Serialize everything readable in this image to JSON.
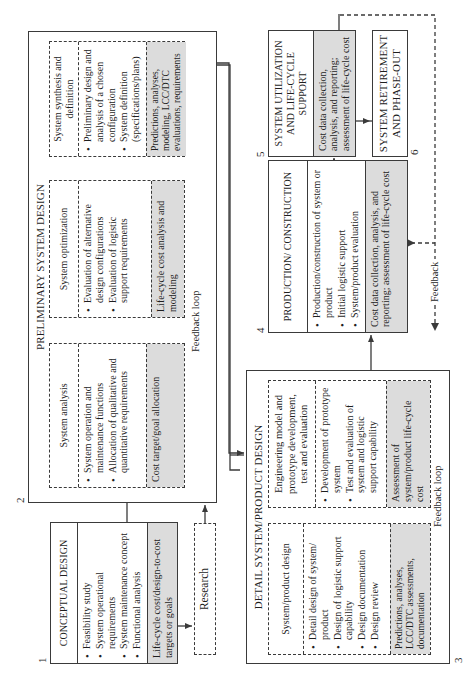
{
  "phases": {
    "conceptual": {
      "number": "1",
      "title": "CONCEPTUAL DESIGN",
      "items": [
        "Feasibility study",
        "System operational requirements",
        "System maintenance concept",
        "Functional analysis"
      ],
      "cost": "Life-cycle cost/design-to-cost targets or goals"
    },
    "research": {
      "label": "Research"
    },
    "preliminary": {
      "number": "2",
      "title": "PRELIMINARY SYSTEM DESIGN",
      "blocks": [
        {
          "title": "System analysis",
          "items": [
            "System operation and maintenance functions",
            "Allocation of qualitative and quantitative requirements"
          ],
          "cost": "Cost target/goal allocation"
        },
        {
          "title": "System optimization",
          "items": [
            "Evaluation of alternative design configurations",
            "Evaluation of logistic support requirements"
          ],
          "cost": "Life-cycle cost analysis and modeling"
        },
        {
          "title": "System synthesis and definition",
          "items": [
            "Preliminary design and analysis of a chosen configuration",
            "System definition (specifications/plans)"
          ],
          "cost": "Predictions, analyses, modeling, LCC/DTC evaluations, requirements"
        }
      ],
      "feedback_label": "Feedback loop"
    },
    "detail": {
      "number": "3",
      "title": "DETAIL SYSTEM/PRODUCT DESIGN",
      "blocks": [
        {
          "title": "System/product design",
          "items": [
            "Detail design of system/ product",
            "Design of logistic support capability",
            "Design documentation",
            "Design review"
          ],
          "cost": "Predictions, analyses, LCC/DTC assessments, documentation"
        },
        {
          "title": "Engineering model and prototype development, test and evaluation",
          "items": [
            "Development of prototype system",
            "Test and evaluation of system and logistic support capability"
          ],
          "cost": "Assessment of system/product life-cycle cost"
        }
      ],
      "feedback_label": "Feedback loop"
    },
    "production": {
      "number": "4",
      "title": "PRODUCTION/ CONSTRUCTION",
      "items": [
        "Production/construction of system or product",
        "Initial logistic support",
        "System/product evaluation"
      ],
      "cost": "Cost data collection, analysis, and reporting; assessment of life-cycle cost"
    },
    "utilization": {
      "number": "5",
      "title": "SYSTEM UTILIZATION AND LIFE-CYCLE SUPPORT",
      "cost": "Cost data collection, analysis, and reporting; assessment of life-cycle cost"
    },
    "retirement": {
      "number": "6",
      "title": "SYSTEM RETIREMENT AND PHASE-OUT"
    },
    "feedback_label": "Feedback"
  },
  "colors": {
    "line": "#3a3a3a",
    "shade": "#dcdcdc",
    "background": "#ffffff"
  }
}
